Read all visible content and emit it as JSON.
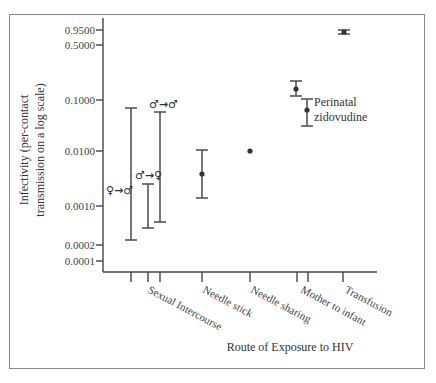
{
  "chart_data": {
    "type": "scatter",
    "title": "",
    "xlabel": "Route of Exposure to HIV",
    "ylabel": "Infectivity (per-contact transmission on a log scale)",
    "ylabel_lines": [
      "Infectivity (per-contact",
      "transmission on a log scale)"
    ],
    "yscale": "log",
    "ylim": [
      0.0001,
      0.95
    ],
    "yticks": [
      {
        "value": 0.95,
        "label": "0.9500",
        "y": 30
      },
      {
        "value": 0.5,
        "label": "0.5000",
        "y": 45
      },
      {
        "value": 0.1,
        "label": "0.1000",
        "y": 100
      },
      {
        "value": 0.01,
        "label": "0.0100",
        "y": 151
      },
      {
        "value": 0.001,
        "label": "0.0010",
        "y": 206
      },
      {
        "value": 0.0002,
        "label": "0.0002",
        "y": 245
      },
      {
        "value": 0.0001,
        "label": "0.0001",
        "y": 261
      }
    ],
    "categories": [
      "Sexual Intercourse",
      "Needle stick",
      "Needle sharing",
      "Mother to infant",
      "Transfusion"
    ],
    "category_labels": [
      {
        "label": "Sexual Intercourse",
        "x": 147,
        "y": 292
      },
      {
        "label": "Needle stick",
        "x": 202,
        "y": 292
      },
      {
        "label": "Needle sharing",
        "x": 250,
        "y": 292
      },
      {
        "label": "Mother to infant",
        "x": 300,
        "y": 292
      },
      {
        "label": "Transfusion",
        "x": 344,
        "y": 292
      }
    ],
    "series": [
      {
        "name": "Sexual intercourse female→male",
        "symbol": "♀→♂",
        "x": 131,
        "low": 0.0002,
        "high": 0.08,
        "point": null,
        "y_low": 240,
        "y_high": 108,
        "y_point": null
      },
      {
        "name": "Sexual intercourse male→female",
        "symbol": "♂→♀",
        "x": 148,
        "low": 0.0004,
        "high": 0.0025,
        "point": null,
        "y_low": 228,
        "y_high": 184,
        "y_point": null
      },
      {
        "name": "Sexual intercourse male→male",
        "symbol": "♂→♂",
        "x": 160,
        "low": 0.0005,
        "high": 0.07,
        "point": null,
        "y_low": 222,
        "y_high": 112,
        "y_point": null
      },
      {
        "name": "Needle stick",
        "x": 202,
        "low": 0.0015,
        "high": 0.01,
        "point": 0.004,
        "y_low": 198,
        "y_high": 150,
        "y_point": 174
      },
      {
        "name": "Needle sharing",
        "x": 250,
        "low": null,
        "high": null,
        "point": 0.01,
        "y_low": null,
        "y_high": null,
        "y_point": 151
      },
      {
        "name": "Mother to infant",
        "x": 296,
        "low": 0.13,
        "high": 0.24,
        "point": 0.17,
        "y_low": 96,
        "y_high": 81,
        "y_point": 89
      },
      {
        "name": "Perinatal zidovudine",
        "x": 307,
        "low": 0.03,
        "high": 0.1,
        "point": 0.06,
        "y_low": 126,
        "y_high": 99,
        "y_point": 110
      },
      {
        "name": "Transfusion",
        "x": 344,
        "low": 0.9,
        "high": 0.98,
        "point": 0.95,
        "y_low": 34,
        "y_high": 30,
        "y_point": 32
      }
    ],
    "annotations": [
      {
        "text_lines": [
          "Perinatal",
          "zidovudine"
        ],
        "x": 314,
        "y": 106
      },
      {
        "text": "♀→♂",
        "x": 106,
        "y": 194
      },
      {
        "text": "♂→♀",
        "x": 135,
        "y": 179
      },
      {
        "text": "♂→♂",
        "x": 149,
        "y": 108
      }
    ],
    "x_ticks": [
      131,
      148,
      160,
      202,
      250,
      297,
      308,
      343
    ],
    "grid": false,
    "legend": null
  }
}
